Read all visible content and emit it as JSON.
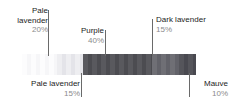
{
  "chart_data": {
    "type": "bar",
    "title": "",
    "subtitle": "",
    "xlabel": "",
    "ylabel": "",
    "orientation": "horizontal-stacked",
    "grid": false,
    "legend_position": "callouts",
    "categories": [
      "Pale lavender",
      "Pale lavender",
      "Purple",
      "Dark lavender",
      "Mauve"
    ],
    "values": [
      20,
      15,
      40,
      15,
      10
    ],
    "value_labels": [
      "20%",
      "15%",
      "40%",
      "15%",
      "10%"
    ],
    "unit": "%",
    "total": 100,
    "series": [
      {
        "name": "Color composition",
        "values": [
          20,
          15,
          40,
          15,
          10
        ]
      }
    ],
    "segments": [
      {
        "id": "pale-lavender-20",
        "name": "Pale lavender",
        "percent": 20,
        "percent_label": "20%",
        "color": "#fcfcfd",
        "stripe_color": "#f6f6f8",
        "callout_position": "top",
        "leader_x_pct": 15
      },
      {
        "id": "pale-lavender-15",
        "name": "Pale lavender",
        "percent": 15,
        "percent_label": "15%",
        "color": "#eeeef1",
        "stripe_color": "#e4e4e9",
        "callout_position": "bottom",
        "leader_x_pct": 34
      },
      {
        "id": "purple-40",
        "name": "Purple",
        "percent": 40,
        "percent_label": "40%",
        "color": "#59595e",
        "stripe_color": "#4c4c51",
        "callout_position": "top",
        "leader_x_pct": 48
      },
      {
        "id": "dark-lavender-15",
        "name": "Dark lavender",
        "percent": 15,
        "percent_label": "15%",
        "color": "#6f6f75",
        "stripe_color": "#626269",
        "callout_position": "top",
        "leader_x_pct": 75
      },
      {
        "id": "mauve-10",
        "name": "Mauve",
        "percent": 10,
        "percent_label": "10%",
        "color": "#55555b",
        "stripe_color": "#494950",
        "callout_position": "bottom",
        "leader_x_pct": 95
      }
    ]
  },
  "callouts": {
    "pale_lavender_20": {
      "name": "Pale",
      "name_line2": "lavender",
      "percent": "20%"
    },
    "purple_40": {
      "name": "Purple",
      "percent": "40%"
    },
    "dark_lavender_15": {
      "name": "Dark lavender",
      "percent": "15%"
    },
    "pale_lavender_15": {
      "name": "Pale lavender",
      "percent": "15%"
    },
    "mauve_10": {
      "name": "Mauve",
      "percent": "10%"
    }
  },
  "colors": {
    "label_text": "#1c1c1c",
    "percent_text": "#8b8b8b",
    "leader_line": "#6a6a6a",
    "background": "#ffffff"
  }
}
